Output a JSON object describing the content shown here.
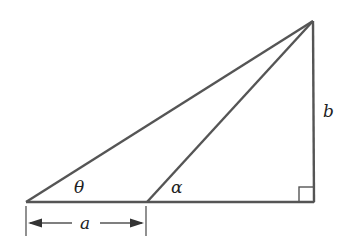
{
  "diagram": {
    "type": "right-triangle-geometry",
    "labels": {
      "theta": "θ",
      "alpha": "α",
      "a": "a",
      "b": "b"
    },
    "points": {
      "left_base": [
        26,
        202
      ],
      "mid_base": [
        147,
        202
      ],
      "right_angle": [
        314,
        202
      ],
      "apex": [
        313,
        21
      ]
    },
    "colors": {
      "stroke": "#555555",
      "text": "#222222"
    }
  }
}
